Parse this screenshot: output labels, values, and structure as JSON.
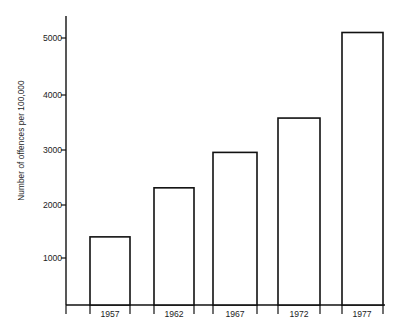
{
  "chart_data": {
    "type": "bar",
    "title": "",
    "subtitle": "",
    "xlabel": "",
    "ylabel": "Number of offences per 100,000",
    "categories": [
      "1957",
      "1962",
      "1967",
      "1972",
      "1977"
    ],
    "values": [
      1250,
      2150,
      2800,
      3430,
      5000
    ],
    "series": [
      {
        "name": "Number of offences per 100,000",
        "values": [
          1250,
          2150,
          2800,
          3430,
          5000
        ]
      }
    ],
    "ylim": [
      0,
      5400
    ],
    "xlim_note": "categorical",
    "ytick_labels": [
      "1000",
      "2000",
      "3000",
      "4000",
      "5000"
    ],
    "ytick_values": [
      1000,
      2000,
      3000,
      4000,
      5000
    ],
    "xtick_labels": [
      "1957",
      "1962",
      "1967",
      "1972",
      "1977"
    ],
    "grid": false,
    "legend": false,
    "legend_position": "none",
    "bar_fill_color": "#ffffff",
    "bar_edge_color": "#111111",
    "axis_color": "#111111",
    "background_color": "#ffffff",
    "annotations": []
  },
  "geometry": {
    "axis_x": 66,
    "baseline_y": 305,
    "axis_top_y": 16,
    "baseline_right_x": 385,
    "px_per_1000": 54.5,
    "bars": [
      {
        "x": 90,
        "width": 40,
        "top": 240
      },
      {
        "x": 154,
        "width": 40,
        "top": 197
      },
      {
        "x": 213,
        "width": 44,
        "top": 161
      },
      {
        "x": 278,
        "width": 42,
        "top": 126
      },
      {
        "x": 342,
        "width": 41,
        "top": 40
      }
    ],
    "ytick_y": [
      258,
      205,
      150,
      95,
      38
    ],
    "xlabel_y": 309,
    "xlabel_centers": [
      110,
      174,
      235,
      299,
      362
    ],
    "xtick_x": [
      66,
      90,
      130,
      154,
      194,
      213,
      257,
      278,
      320,
      342,
      383
    ],
    "xtick_len": 9
  }
}
